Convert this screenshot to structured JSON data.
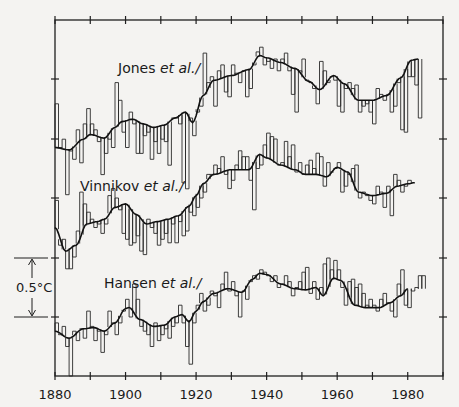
{
  "chart_data": {
    "type": "line",
    "title": "",
    "xlabel": "",
    "ylabel": "",
    "xlim": [
      1880,
      1990
    ],
    "x_ticks": [
      1880,
      1900,
      1920,
      1940,
      1960,
      1980
    ],
    "x_tick_labels": [
      "1880",
      "1900",
      "1920",
      "1940",
      "1960",
      "1980"
    ],
    "minor_x_tick_step": 10,
    "y_tick_step_c": 0.5,
    "grid": false,
    "legend": "inline labels",
    "scale_bar": {
      "label": "0.5°C",
      "value_c": 0.5
    },
    "series": [
      {
        "name": "Jones et al./",
        "label_main": "Jones",
        "label_ital": "et al./",
        "baseline_px": 118,
        "label_pos": [
          118,
          73
        ],
        "x_start": 1880,
        "annual_c": [
          0.12,
          -0.25,
          -0.18,
          -0.65,
          -0.28,
          -0.35,
          -0.1,
          -0.38,
          -0.05,
          0.08,
          -0.05,
          -0.1,
          -0.2,
          -0.48,
          -0.3,
          -0.18,
          -0.25,
          0.3,
          0.15,
          -0.12,
          -0.25,
          0.05,
          -0.05,
          -0.3,
          -0.3,
          -0.15,
          -0.12,
          -0.35,
          -0.2,
          -0.3,
          -0.18,
          -0.2,
          -0.4,
          0.0,
          0.0,
          -0.05,
          -0.55,
          -0.6,
          0.0,
          -0.15,
          0.05,
          0.1,
          0.55,
          0.3,
          0.35,
          0.1,
          0.4,
          0.45,
          0.22,
          0.18,
          0.45,
          0.38,
          0.3,
          0.4,
          0.18,
          0.25,
          0.45,
          0.56,
          0.6,
          0.45,
          0.48,
          0.42,
          0.5,
          0.4,
          0.5,
          0.55,
          0.4,
          0.2,
          0.05,
          0.4,
          0.5,
          0.32,
          0.3,
          0.25,
          0.12,
          0.48,
          0.4,
          0.3,
          0.35,
          0.32,
          0.1,
          0.05,
          0.25,
          0.3,
          0.25,
          0.28,
          0.05,
          0.1,
          0.12,
          0.05,
          -0.05,
          0.25,
          0.2,
          0.15,
          0.2,
          0.05,
          0.1,
          0.3,
          -0.1,
          -0.12,
          0.35,
          0.35,
          0.28,
          0.0
        ],
        "smooth_knots": [
          [
            1880,
            -0.25
          ],
          [
            1884,
            -0.27
          ],
          [
            1888,
            -0.18
          ],
          [
            1890,
            -0.14
          ],
          [
            1894,
            -0.17
          ],
          [
            1897,
            -0.08
          ],
          [
            1899,
            -0.03
          ],
          [
            1902,
            -0.01
          ],
          [
            1905,
            -0.05
          ],
          [
            1908,
            -0.08
          ],
          [
            1911,
            -0.06
          ],
          [
            1914,
            0.0
          ],
          [
            1917,
            0.05
          ],
          [
            1919,
            -0.04
          ],
          [
            1922,
            0.19
          ],
          [
            1925,
            0.32
          ],
          [
            1930,
            0.36
          ],
          [
            1935,
            0.41
          ],
          [
            1938,
            0.53
          ],
          [
            1940,
            0.51
          ],
          [
            1944,
            0.47
          ],
          [
            1948,
            0.42
          ],
          [
            1952,
            0.31
          ],
          [
            1955,
            0.24
          ],
          [
            1959,
            0.36
          ],
          [
            1962,
            0.29
          ],
          [
            1966,
            0.15
          ],
          [
            1970,
            0.15
          ],
          [
            1974,
            0.19
          ],
          [
            1978,
            0.34
          ],
          [
            1981,
            0.49
          ],
          [
            1983,
            0.5
          ]
        ]
      },
      {
        "name": "Vinnikov et al./",
        "label_main": "Vinnikov",
        "label_ital": "et al./",
        "baseline_px": 198,
        "label_pos": [
          80,
          191
        ],
        "x_start": 1880,
        "annual_c": [
          -0.02,
          -0.4,
          -0.35,
          -0.6,
          -0.6,
          -0.5,
          -0.28,
          0.05,
          -0.05,
          -0.12,
          -0.18,
          -0.25,
          -0.22,
          -0.3,
          -0.22,
          0.02,
          0.08,
          0.0,
          -0.1,
          -0.3,
          -0.35,
          -0.4,
          -0.38,
          -0.32,
          -0.45,
          -0.48,
          -0.18,
          -0.25,
          -0.3,
          -0.4,
          -0.35,
          -0.3,
          -0.38,
          -0.22,
          -0.38,
          -0.2,
          -0.32,
          -0.28,
          -0.12,
          -0.15,
          -0.08,
          0.0,
          0.05,
          0.2,
          0.2,
          0.28,
          0.25,
          0.35,
          0.2,
          0.08,
          0.15,
          0.28,
          0.4,
          0.35,
          0.35,
          0.15,
          -0.1,
          0.25,
          0.28,
          0.45,
          0.55,
          0.52,
          0.5,
          0.28,
          0.3,
          0.48,
          0.35,
          0.45,
          0.22,
          0.3,
          0.2,
          0.28,
          0.32,
          0.25,
          0.38,
          0.35,
          0.1,
          0.3,
          0.22,
          0.25,
          0.3,
          0.05,
          0.1,
          0.2,
          0.25,
          0.28,
          0.0,
          0.05,
          0.02,
          -0.02,
          -0.05,
          0.1,
          0.05,
          -0.08,
          0.1,
          -0.15,
          0.2,
          0.15,
          0.05,
          0.1,
          0.15
        ],
        "smooth_knots": [
          [
            1880,
            -0.25
          ],
          [
            1883,
            -0.45
          ],
          [
            1886,
            -0.4
          ],
          [
            1889,
            -0.22
          ],
          [
            1892,
            -0.2
          ],
          [
            1894,
            -0.18
          ],
          [
            1897,
            -0.08
          ],
          [
            1900,
            -0.05
          ],
          [
            1903,
            -0.14
          ],
          [
            1906,
            -0.22
          ],
          [
            1909,
            -0.2
          ],
          [
            1912,
            -0.18
          ],
          [
            1915,
            -0.15
          ],
          [
            1918,
            -0.07
          ],
          [
            1920,
            0.02
          ],
          [
            1922,
            0.12
          ],
          [
            1925,
            0.2
          ],
          [
            1930,
            0.24
          ],
          [
            1935,
            0.24
          ],
          [
            1938,
            0.37
          ],
          [
            1940,
            0.34
          ],
          [
            1944,
            0.28
          ],
          [
            1948,
            0.24
          ],
          [
            1951,
            0.2
          ],
          [
            1954,
            0.2
          ],
          [
            1957,
            0.18
          ],
          [
            1960,
            0.26
          ],
          [
            1963,
            0.22
          ],
          [
            1966,
            0.05
          ],
          [
            1970,
            0.02
          ],
          [
            1974,
            0.04
          ],
          [
            1977,
            0.1
          ],
          [
            1980,
            0.12
          ],
          [
            1982,
            0.13
          ]
        ]
      },
      {
        "name": "Hansen et al./",
        "label_main": "Hansen",
        "label_ital": "et al./",
        "baseline_px": 317,
        "label_pos": [
          104,
          288
        ],
        "x_start": 1880,
        "annual_c": [
          -0.05,
          -0.15,
          -0.08,
          -0.25,
          -0.5,
          -0.12,
          -0.2,
          -0.1,
          -0.18,
          0.05,
          -0.08,
          -0.2,
          -0.12,
          -0.3,
          -0.15,
          0.05,
          -0.05,
          -0.15,
          -0.05,
          0.05,
          0.15,
          0.0,
          0.28,
          0.15,
          -0.08,
          -0.12,
          -0.15,
          -0.25,
          -0.05,
          -0.2,
          -0.15,
          -0.1,
          -0.18,
          -0.08,
          -0.05,
          0.1,
          -0.05,
          -0.25,
          -0.4,
          -0.05,
          0.1,
          0.2,
          0.05,
          0.1,
          0.22,
          0.18,
          0.08,
          0.28,
          0.38,
          0.22,
          0.3,
          0.18,
          0.0,
          0.22,
          0.15,
          0.3,
          0.35,
          0.32,
          0.4,
          0.38,
          0.35,
          0.3,
          0.35,
          0.25,
          0.28,
          0.35,
          0.3,
          0.18,
          0.25,
          0.3,
          0.38,
          0.42,
          0.2,
          0.3,
          0.15,
          0.25,
          0.45,
          0.5,
          0.4,
          0.48,
          0.4,
          0.25,
          0.1,
          0.3,
          0.32,
          0.25,
          0.28,
          0.2,
          0.1,
          0.15,
          0.1,
          0.05,
          0.15,
          0.2,
          0.12,
          0.05,
          0.0,
          0.28,
          0.4,
          0.1,
          0.08,
          0.22,
          0.25,
          0.35,
          0.35
        ],
        "smooth_knots": [
          [
            1880,
            -0.12
          ],
          [
            1884,
            -0.18
          ],
          [
            1888,
            -0.1
          ],
          [
            1891,
            -0.09
          ],
          [
            1894,
            -0.12
          ],
          [
            1897,
            -0.05
          ],
          [
            1900,
            0.07
          ],
          [
            1901,
            0.08
          ],
          [
            1904,
            -0.02
          ],
          [
            1908,
            -0.08
          ],
          [
            1911,
            -0.07
          ],
          [
            1914,
            0.0
          ],
          [
            1916,
            0.02
          ],
          [
            1918,
            -0.04
          ],
          [
            1920,
            0.05
          ],
          [
            1922,
            0.13
          ],
          [
            1925,
            0.2
          ],
          [
            1929,
            0.24
          ],
          [
            1933,
            0.21
          ],
          [
            1936,
            0.32
          ],
          [
            1938,
            0.37
          ],
          [
            1940,
            0.36
          ],
          [
            1944,
            0.28
          ],
          [
            1948,
            0.24
          ],
          [
            1951,
            0.23
          ],
          [
            1954,
            0.25
          ],
          [
            1956,
            0.18
          ],
          [
            1959,
            0.33
          ],
          [
            1961,
            0.31
          ],
          [
            1965,
            0.1
          ],
          [
            1968,
            0.08
          ],
          [
            1972,
            0.08
          ],
          [
            1975,
            0.12
          ],
          [
            1978,
            0.18
          ],
          [
            1980,
            0.24
          ]
        ]
      }
    ]
  }
}
